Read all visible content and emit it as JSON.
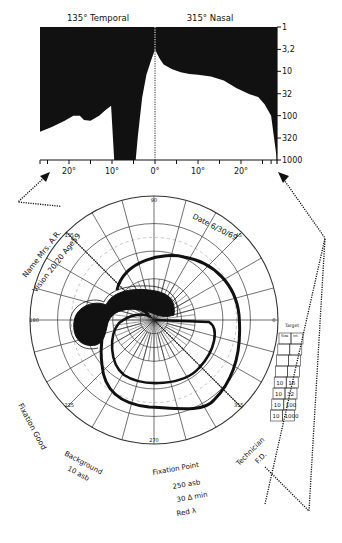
{
  "chart_data": [
    {
      "type": "area",
      "title_left": "135° Temporal",
      "title_right": "315° Nasal",
      "xlabel": "",
      "ylabel": "",
      "x_tick_labels": [
        "20°",
        "10°",
        "0°",
        "10°",
        "20°"
      ],
      "x_ticks_deg": [
        -20,
        -10,
        0,
        10,
        20
      ],
      "xlim": [
        -27,
        27
      ],
      "y_tick_labels": [
        "1",
        "3,2",
        "10",
        "32",
        "100",
        "320",
        "1000"
      ],
      "y_ticks": [
        1,
        3.2,
        10,
        32,
        100,
        320,
        1000
      ],
      "ylim": [
        1,
        1000
      ],
      "y_scale": "log",
      "y_inverted": true,
      "note": "Black region = not seen; white region = seen. Boundary = threshold luminance (asb) vs eccentricity (deg); negative x = temporal side.",
      "threshold_profile": {
        "x": [
          -27,
          -24,
          -21,
          -19,
          -17.5,
          -16.5,
          -15,
          -13,
          -11.5,
          -10.2,
          -9.5,
          -4.5,
          -4,
          -3,
          -2,
          -1,
          0,
          1,
          2,
          4,
          6,
          8,
          10,
          13,
          16,
          19,
          22,
          24,
          25.5,
          27
        ],
        "y": [
          230,
          180,
          130,
          100,
          100,
          125,
          130,
          100,
          75,
          60,
          1000,
          1000,
          300,
          40,
          12,
          6,
          3.2,
          5,
          7,
          9,
          10.5,
          11.5,
          12,
          13,
          16,
          24,
          33,
          38,
          55,
          100
        ]
      }
    },
    {
      "type": "polar-isopter",
      "radial_labels": [
        "90",
        "45",
        "180",
        "0",
        "225",
        "270",
        "315",
        "135"
      ],
      "ring_labels": [
        "10",
        "20",
        "30",
        "50",
        "70",
        "90"
      ],
      "meridian_section_deg": [
        135,
        315
      ],
      "isopters": [
        {
          "name": "10/1000",
          "label": "outer isopter"
        },
        {
          "name": "10/100",
          "label": "inner isopter"
        }
      ],
      "scotoma": "dense central scotoma connecting fixation to blind spot (temporal, 135°-225° side)",
      "target_table": {
        "header": "Target",
        "columns": [
          "Size",
          "Int."
        ],
        "rows": [
          [
            "10",
            "16"
          ],
          [
            "10",
            "32"
          ],
          [
            "10",
            "100"
          ],
          [
            "10",
            "1000"
          ]
        ]
      }
    }
  ],
  "patient": {
    "name_label": "Name",
    "name": "Mrs. A.R.",
    "age_label": "Age",
    "age": "59",
    "vision_label": "Vision",
    "vision": "20/20",
    "date_label": "Date",
    "date": "6/30/69",
    "fixation_label": "Fixation",
    "fixation": "Good",
    "background_label": "Background",
    "background": "10 asb",
    "technician_label": "Technician",
    "technician": "F.D.",
    "fixation_point_label": "Fixation Point",
    "fixation_point_lum": "250 asb",
    "fixation_point_size": "30 Δ min",
    "fixation_point_color": "Red λ"
  },
  "colors": {
    "ink": "#111111",
    "paper": "#ffffff",
    "grid": "#444444",
    "dashed": "#bbbbbb"
  }
}
